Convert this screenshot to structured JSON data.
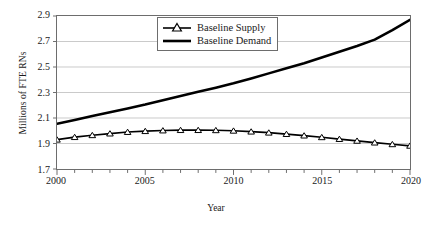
{
  "chart_data": {
    "type": "line",
    "title": "",
    "xlabel": "Year",
    "ylabel": "Millions of FTE RNs",
    "xlim": [
      2000,
      2020
    ],
    "ylim": [
      1.7,
      2.9
    ],
    "yticks": [
      "2.9",
      "2.7",
      "2.5",
      "2.3",
      "2.1",
      "1.9",
      "1.7"
    ],
    "ytick_values": [
      2.9,
      2.7,
      2.5,
      2.3,
      2.1,
      1.9,
      1.7
    ],
    "xticks": [
      "2000",
      "2005",
      "2010",
      "2015",
      "2020"
    ],
    "xtick_values": [
      2000,
      2005,
      2010,
      2015,
      2020
    ],
    "x": [
      2000,
      2001,
      2002,
      2003,
      2004,
      2005,
      2006,
      2007,
      2008,
      2009,
      2010,
      2011,
      2012,
      2013,
      2014,
      2015,
      2016,
      2017,
      2018,
      2019,
      2020
    ],
    "grid": true,
    "grid_axis": "y",
    "legend_position": "top-center",
    "series": [
      {
        "name": "Baseline Supply",
        "marker": "triangle",
        "color": "#000000",
        "values": [
          1.93,
          1.95,
          1.965,
          1.978,
          1.99,
          1.997,
          2.002,
          2.005,
          2.005,
          2.004,
          2.0,
          1.993,
          1.985,
          1.974,
          1.962,
          1.949,
          1.935,
          1.921,
          1.907,
          1.894,
          1.882
        ]
      },
      {
        "name": "Baseline Demand",
        "marker": "none",
        "color": "#000000",
        "values": [
          2.055,
          2.085,
          2.115,
          2.145,
          2.175,
          2.205,
          2.24,
          2.272,
          2.305,
          2.338,
          2.372,
          2.41,
          2.45,
          2.49,
          2.53,
          2.575,
          2.62,
          2.665,
          2.715,
          2.79,
          2.87
        ]
      }
    ]
  },
  "legend": {
    "items": [
      {
        "label": "Baseline Supply"
      },
      {
        "label": "Baseline Demand"
      }
    ]
  },
  "colors": {
    "line": "#000000",
    "grid": "#c9c9c9",
    "frame": "#6d6d6d",
    "background": "#ffffff",
    "text": "#1a1a1a"
  }
}
